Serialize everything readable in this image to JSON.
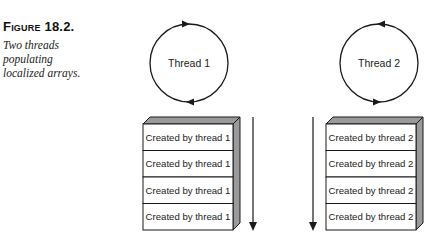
{
  "figure": {
    "label": "Figure 18.2.",
    "description": "Two threads populating localized arrays."
  },
  "threads": [
    {
      "name": "Thread 1",
      "rotation": "clockwise",
      "cells": [
        "Created by thread 1",
        "Created by thread 1",
        "Created by thread 1",
        "Created by thread 1"
      ],
      "arrow_side": "right"
    },
    {
      "name": "Thread 2",
      "rotation": "counterclockwise",
      "cells": [
        "Created by thread 2",
        "Created by thread 2",
        "Created by thread 2",
        "Created by thread 2"
      ],
      "arrow_side": "left"
    }
  ],
  "colors": {
    "stroke": "#1a1a1a",
    "bevel": "#9a9a9a",
    "cell_fill": "#ffffff"
  }
}
